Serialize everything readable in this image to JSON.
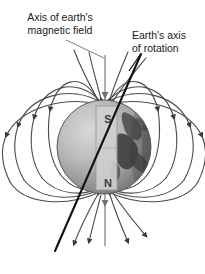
{
  "figure": {
    "background_color": "#ffffff",
    "width": 205,
    "height": 274
  },
  "labels": {
    "magnetic_axis": "Axis of earth's\nmagnetic field",
    "rotation_axis": "Earth's axis\nof rotation"
  },
  "magnet": {
    "south_pole": "S",
    "north_pole": "N",
    "body_color": "#cfcfcf",
    "border_color": "#9a9a9a"
  },
  "globe": {
    "center_x": 104,
    "center_y": 147,
    "radius": 47,
    "light_color": "#c9c9c9",
    "mid_color": "#9e9e9e",
    "dark_color": "#6e6e6e",
    "continent_color": "#4a4a4a",
    "outline_color": "#5a5a5a"
  },
  "axes": {
    "magnetic": {
      "color": "#8c8c8c",
      "width": 1.4,
      "x": 105,
      "y_top": 55,
      "y_bottom": 246
    },
    "rotation": {
      "color": "#111111",
      "width": 2.1,
      "x_top": 141,
      "y_top": 54,
      "x_bottom": 55,
      "y_bottom": 251
    }
  },
  "field_lines": {
    "color": "#4a4a4a",
    "width": 1.1,
    "arrow_color": "#3a3a3a",
    "description": "Nested dipole field loops exiting the south magnetic pole region and re-entering at the north, symmetric left and right"
  },
  "leader_lines": {
    "magnetic_label": {
      "color": "#6e6e6e",
      "from_x": 66,
      "from_y": 40,
      "to_x": 104,
      "to_y": 57
    },
    "rotation_label": {
      "color": "#111111",
      "from_x": 139,
      "from_y": 56,
      "to_x": 128,
      "to_y": 72
    }
  }
}
